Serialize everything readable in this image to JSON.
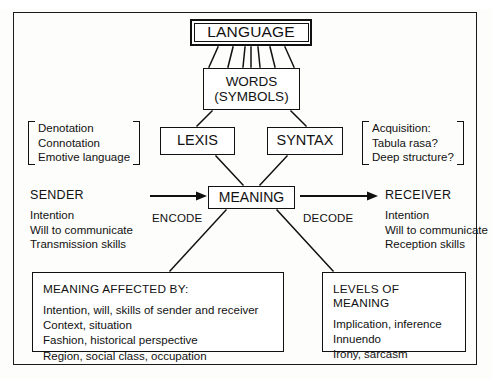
{
  "diagram": {
    "nodes": {
      "language": "LANGUAGE",
      "words_line1": "WORDS",
      "words_line2": "(SYMBOLS)",
      "lexis": "LEXIS",
      "syntax": "SYNTAX",
      "meaning": "MEANING"
    },
    "lexis_notes": [
      "Denotation",
      "Connotation",
      "Emotive language"
    ],
    "syntax_notes": [
      "Acquisition:",
      "Tabula rasa?",
      "Deep structure?"
    ],
    "sender": {
      "title": "SENDER",
      "items": [
        "Intention",
        "Will to communicate",
        "Transmission skills"
      ]
    },
    "receiver": {
      "title": "RECEIVER",
      "items": [
        "Intention",
        "Will to communicate",
        "Reception skills"
      ]
    },
    "encode_label": "ENCODE",
    "decode_label": "DECODE",
    "affected_box": {
      "title": "MEANING AFFECTED BY:",
      "items": [
        "Intention, will, skills of sender and receiver",
        "Context, situation",
        "Fashion, historical perspective",
        "Region, social class, occupation"
      ]
    },
    "levels_box": {
      "title": "LEVELS OF MEANING",
      "items": [
        "Implication, inference",
        "Innuendo",
        "Irony, sarcasm"
      ]
    },
    "colors": {
      "ink": "#111111",
      "paper": "#fdfdfb"
    }
  }
}
